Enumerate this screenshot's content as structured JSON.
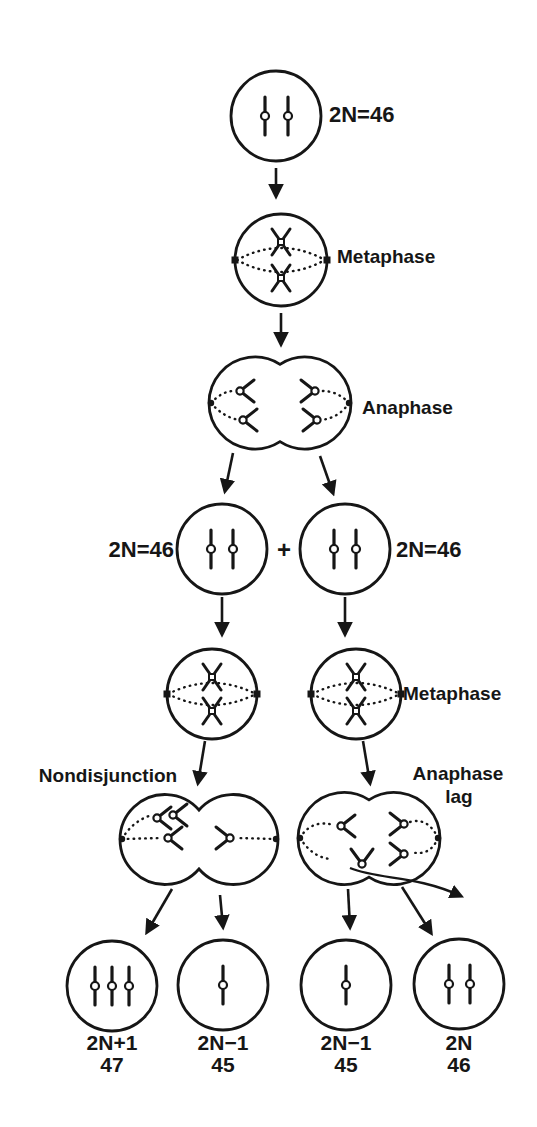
{
  "diagram": {
    "colors": {
      "ink": "#161616",
      "background": "#ffffff"
    },
    "top_cell": {
      "ploidy": "2N=46"
    },
    "phase_labels": {
      "metaphase_1": "Metaphase",
      "anaphase_1": "Anaphase",
      "metaphase_2": "Metaphase"
    },
    "daughter_row": {
      "left_ploidy": "2N=46",
      "plus": "+",
      "right_ploidy": "2N=46"
    },
    "error_labels": {
      "nondisjunction": "Nondisjunction",
      "anaphase_lag_line1": "Anaphase",
      "anaphase_lag_line2": "lag"
    },
    "outcomes": [
      {
        "ploidy": "2N+1",
        "count": "47"
      },
      {
        "ploidy": "2N−1",
        "count": "45"
      },
      {
        "ploidy": "2N−1",
        "count": "45"
      },
      {
        "ploidy": "2N",
        "count": "46"
      }
    ]
  }
}
